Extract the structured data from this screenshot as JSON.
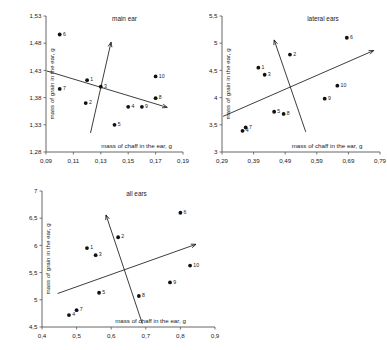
{
  "figure": {
    "axis_x_label": "mass of chaff in the ear, g",
    "axis_y_label": "mass of grain in the ear, g",
    "accent_color": "#111111",
    "axis_color": "#555555"
  },
  "chart_data": [
    {
      "id": "main-ear",
      "type": "scatter",
      "title": "main ear",
      "xlabel": "mass of chaff in the ear, g",
      "ylabel": "mass of grain in the ear, g",
      "xlim": [
        0.09,
        0.19
      ],
      "ylim": [
        1.28,
        1.53
      ],
      "xticks": [
        "0,09",
        "0,11",
        "0,13",
        "0,15",
        "0,17",
        "0,19"
      ],
      "xtick_values": [
        0.09,
        0.11,
        0.13,
        0.15,
        0.17,
        0.19
      ],
      "yticks": [
        "1,53",
        "1,48",
        "1,43",
        "1,38",
        "1,33",
        "1,28"
      ],
      "ytick_values": [
        1.53,
        1.48,
        1.43,
        1.38,
        1.33,
        1.28
      ],
      "grid": false,
      "legend": "none",
      "points": [
        {
          "label": "1",
          "x": 0.12,
          "y": 1.412
        },
        {
          "label": "2",
          "x": 0.119,
          "y": 1.37
        },
        {
          "label": "3",
          "x": 0.13,
          "y": 1.4
        },
        {
          "label": "4",
          "x": 0.15,
          "y": 1.363
        },
        {
          "label": "5",
          "x": 0.14,
          "y": 1.33
        },
        {
          "label": "6",
          "x": 0.1,
          "y": 1.496
        },
        {
          "label": "7",
          "x": 0.1,
          "y": 1.396
        },
        {
          "label": "8",
          "x": 0.17,
          "y": 1.379
        },
        {
          "label": "9",
          "x": 0.16,
          "y": 1.363
        },
        {
          "label": "10",
          "x": 0.17,
          "y": 1.419
        }
      ],
      "lines": [
        {
          "name": "axis-1",
          "x1": 0.0905,
          "y1": 1.429,
          "x2": 0.1785,
          "y2": 1.362,
          "arrow": "end"
        },
        {
          "name": "axis-2",
          "x1": 0.1225,
          "y1": 1.315,
          "x2": 0.1375,
          "y2": 1.482,
          "arrow": "end"
        }
      ]
    },
    {
      "id": "lateral-ears",
      "type": "scatter",
      "title": "lateral ears",
      "xlabel": "mass of chaff in the ear, g",
      "ylabel": "mass of grain in the ear, g",
      "xlim": [
        0.29,
        0.79
      ],
      "ylim": [
        3.0,
        5.5
      ],
      "xticks": [
        "0,29",
        "0,39",
        "0,49",
        "0,59",
        "0,69",
        "0,79"
      ],
      "xtick_values": [
        0.29,
        0.39,
        0.49,
        0.59,
        0.69,
        0.79
      ],
      "yticks": [
        "5,5",
        "5",
        "4,5",
        "4",
        "3,5",
        "3"
      ],
      "ytick_values": [
        5.5,
        5.0,
        4.5,
        4.0,
        3.5,
        3.0
      ],
      "grid": false,
      "legend": "none",
      "points": [
        {
          "label": "1",
          "x": 0.405,
          "y": 4.55
        },
        {
          "label": "2",
          "x": 0.505,
          "y": 4.79
        },
        {
          "label": "3",
          "x": 0.425,
          "y": 4.42
        },
        {
          "label": "4",
          "x": 0.355,
          "y": 3.39
        },
        {
          "label": "5",
          "x": 0.455,
          "y": 3.74
        },
        {
          "label": "6",
          "x": 0.685,
          "y": 5.1
        },
        {
          "label": "7",
          "x": 0.365,
          "y": 3.45
        },
        {
          "label": "8",
          "x": 0.485,
          "y": 3.7
        },
        {
          "label": "9",
          "x": 0.615,
          "y": 3.98
        },
        {
          "label": "10",
          "x": 0.655,
          "y": 4.22
        }
      ],
      "lines": [
        {
          "name": "axis-1",
          "x1": 0.2935,
          "y1": 3.655,
          "x2": 0.77,
          "y2": 4.865,
          "arrow": "end"
        },
        {
          "name": "axis-2",
          "x1": 0.555,
          "y1": 3.37,
          "x2": 0.455,
          "y2": 5.06,
          "arrow": "end"
        }
      ]
    },
    {
      "id": "all-ears",
      "type": "scatter",
      "title": "all ears",
      "xlabel": "mass of chaff in the ear, g",
      "ylabel": "mass of grain in the ear, g",
      "xlim": [
        0.4,
        0.9
      ],
      "ylim": [
        4.5,
        7.0
      ],
      "xticks": [
        "0,4",
        "0,5",
        "0,6",
        "0,7",
        "0,8",
        "0,9"
      ],
      "xtick_values": [
        0.4,
        0.5,
        0.6,
        0.7,
        0.8,
        0.9
      ],
      "yticks": [
        "7",
        "6,5",
        "6",
        "5,5",
        "5",
        "4,5"
      ],
      "ytick_values": [
        7.0,
        6.5,
        6.0,
        5.5,
        5.0,
        4.5
      ],
      "grid": false,
      "legend": "none",
      "points": [
        {
          "label": "1",
          "x": 0.53,
          "y": 5.95
        },
        {
          "label": "2",
          "x": 0.62,
          "y": 6.15
        },
        {
          "label": "3",
          "x": 0.555,
          "y": 5.82
        },
        {
          "label": "4",
          "x": 0.478,
          "y": 4.72
        },
        {
          "label": "5",
          "x": 0.565,
          "y": 5.13
        },
        {
          "label": "6",
          "x": 0.8,
          "y": 6.6
        },
        {
          "label": "7",
          "x": 0.5,
          "y": 4.81
        },
        {
          "label": "8",
          "x": 0.68,
          "y": 5.07
        },
        {
          "label": "9",
          "x": 0.77,
          "y": 5.32
        },
        {
          "label": "10",
          "x": 0.828,
          "y": 5.63
        }
      ],
      "lines": [
        {
          "name": "axis-1",
          "x1": 0.445,
          "y1": 5.115,
          "x2": 0.845,
          "y2": 6.02,
          "arrow": "end"
        },
        {
          "name": "axis-2",
          "x1": 0.69,
          "y1": 4.56,
          "x2": 0.585,
          "y2": 6.56,
          "arrow": "end"
        }
      ]
    }
  ]
}
